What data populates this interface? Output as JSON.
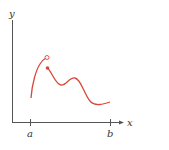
{
  "figure": {
    "axes": {
      "x_label": "x",
      "y_label": "y",
      "color": "#555555"
    },
    "ticks": [
      {
        "label": "a",
        "x": 30
      },
      {
        "label": "b",
        "x": 110
      }
    ],
    "curve": {
      "color": "#d9473a",
      "left_piece_end": "open-circle",
      "right_piece_start": "filled-dot"
    }
  }
}
